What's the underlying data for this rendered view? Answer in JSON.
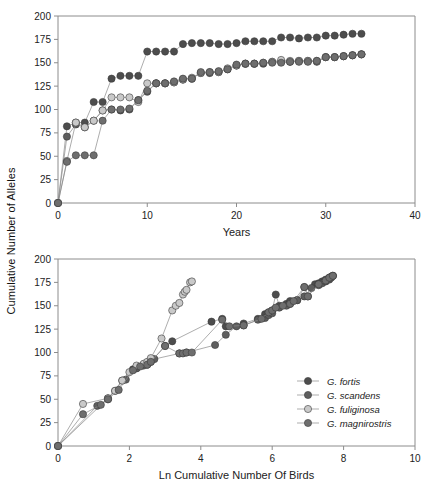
{
  "figure": {
    "y_axis_label": "Cumulative Number of Alleles"
  },
  "legend": {
    "items": [
      {
        "label": "G. fortis",
        "color": "#4d4d4d"
      },
      {
        "label": "G. scandens",
        "color": "#5e5e5e"
      },
      {
        "label": "G. fuliginosa",
        "color": "#c9c9c9"
      },
      {
        "label": "G. magnirostris",
        "color": "#6e6e6e"
      }
    ]
  },
  "chart_data": [
    {
      "type": "line",
      "panel": "top",
      "title": "",
      "xlabel": "Years",
      "ylabel": "Cumulative Number of Alleles",
      "xlim": [
        0,
        40
      ],
      "ylim": [
        0,
        200
      ],
      "xticks": [
        0,
        10,
        20,
        30,
        40
      ],
      "yticks": [
        0,
        25,
        50,
        75,
        100,
        125,
        150,
        175,
        200
      ],
      "grid": false,
      "legend_position": "none",
      "series": [
        {
          "name": "G. fortis",
          "color": "#4d4d4d",
          "x": [
            0,
            1,
            2,
            3,
            4,
            5,
            6,
            7,
            8,
            9,
            10,
            11,
            12,
            13,
            14,
            15,
            16,
            17,
            18,
            19,
            20,
            21,
            22,
            23,
            24,
            25,
            26,
            27,
            28,
            29,
            30,
            31,
            32,
            33,
            34
          ],
          "y": [
            0,
            82,
            86,
            86,
            108,
            108,
            133,
            136,
            136,
            136,
            162,
            162,
            162,
            162,
            170,
            171,
            171,
            171,
            170,
            170,
            171,
            173,
            173,
            173,
            173,
            177,
            177,
            176,
            177,
            177,
            179,
            179,
            180,
            181,
            181
          ]
        },
        {
          "name": "G. scandens",
          "color": "#5e5e5e",
          "x": [
            0,
            1,
            2,
            3,
            4,
            5,
            6,
            7,
            8,
            9,
            10,
            11,
            12,
            13,
            14,
            15,
            16,
            17,
            18,
            19,
            20,
            21,
            22,
            23,
            24,
            25,
            26,
            27,
            28,
            29,
            30,
            31,
            32,
            33,
            34
          ],
          "y": [
            0,
            71,
            84,
            81,
            88,
            99,
            100,
            99,
            100,
            110,
            119,
            128,
            128,
            129,
            132,
            133,
            139,
            139,
            140,
            143,
            147,
            149,
            149,
            149,
            151,
            151,
            151,
            152,
            152,
            151,
            156,
            156,
            157,
            158,
            159
          ]
        },
        {
          "name": "G. fuliginosa",
          "color": "#c9c9c9",
          "x": [
            0,
            1,
            2,
            3,
            4,
            5,
            6,
            7,
            8,
            9,
            10,
            11,
            12,
            13,
            14,
            15,
            16,
            17,
            18,
            19,
            20,
            21,
            22,
            23,
            24,
            25,
            26,
            27,
            28,
            29,
            30,
            31,
            32,
            33,
            34
          ],
          "y": [
            0,
            45,
            86,
            81,
            88,
            99,
            113,
            113,
            113,
            108,
            128,
            128,
            128,
            129,
            132,
            134,
            139,
            140,
            140,
            144,
            147,
            149,
            149,
            150,
            151,
            153,
            152,
            152,
            152,
            152,
            156,
            156,
            157,
            158,
            159
          ]
        },
        {
          "name": "G. magnirostris",
          "color": "#6e6e6e",
          "x": [
            0,
            1,
            2,
            3,
            4,
            5,
            6,
            7,
            8,
            9,
            10,
            11,
            12,
            13,
            14,
            15,
            16,
            17,
            18,
            19,
            20,
            21,
            22,
            23,
            24,
            25,
            26,
            27,
            28,
            29,
            30,
            31,
            32,
            33,
            34
          ],
          "y": [
            0,
            44,
            51,
            51,
            51,
            88,
            100,
            100,
            101,
            110,
            120,
            128,
            128,
            130,
            133,
            133,
            140,
            140,
            141,
            143,
            148,
            149,
            149,
            150,
            150,
            150,
            151,
            151,
            151,
            152,
            156,
            156,
            157,
            158,
            159
          ]
        }
      ]
    },
    {
      "type": "scatter",
      "panel": "bottom",
      "title": "",
      "xlabel": "Ln Cumulative Number Of Birds",
      "ylabel": "Cumulative Number of Alleles",
      "xlim": [
        0,
        10
      ],
      "ylim": [
        0,
        200
      ],
      "xticks": [
        0,
        2,
        4,
        6,
        8,
        10
      ],
      "yticks": [
        0,
        25,
        50,
        75,
        100,
        125,
        150,
        175,
        200
      ],
      "grid": false,
      "legend_position": "bottom-right",
      "series": [
        {
          "name": "G. fortis",
          "color": "#4d4d4d",
          "x": [
            0,
            1.4,
            1.8,
            2.1,
            2.2,
            2.5,
            2.6,
            3.0,
            3.2,
            4.3,
            4.6,
            4.7,
            5.2,
            5.6,
            5.8,
            5.9,
            6.0,
            6.1,
            6.2,
            6.4,
            6.5,
            6.7,
            6.9,
            7.0,
            7.2,
            7.3,
            7.4,
            7.5,
            7.6,
            7.65,
            7.7
          ],
          "y": [
            0,
            51,
            70,
            82,
            84,
            87,
            90,
            107,
            112,
            133,
            136,
            128,
            131,
            136,
            141,
            143,
            145,
            162,
            150,
            152,
            155,
            156,
            170,
            160,
            173,
            174,
            176,
            178,
            180,
            181,
            182
          ]
        },
        {
          "name": "G. scandens",
          "color": "#5e5e5e",
          "x": [
            0,
            1.1,
            1.4,
            1.6,
            1.9,
            2.2,
            2.4,
            2.5,
            2.7,
            3.4,
            3.6,
            4.4,
            4.7,
            5.0,
            5.2,
            5.6,
            5.8,
            5.9,
            6.0,
            6.2,
            6.4,
            6.5,
            6.7,
            6.9,
            7.1,
            7.3,
            7.4,
            7.5,
            7.6,
            7.65,
            7.7
          ],
          "y": [
            0,
            43,
            50,
            59,
            71,
            83,
            86,
            88,
            93,
            99,
            100,
            108,
            119,
            128,
            129,
            135,
            137,
            140,
            142,
            148,
            150,
            152,
            156,
            160,
            169,
            172,
            174,
            176,
            178,
            180,
            182
          ]
        },
        {
          "name": "G. fuliginosa",
          "color": "#c9c9c9",
          "x": [
            0,
            0.7,
            1.4,
            1.6,
            1.8,
            2.0,
            2.2,
            2.4,
            2.5,
            2.6,
            2.9,
            3.2,
            3.3,
            3.4,
            3.5,
            3.55,
            3.6,
            3.7,
            3.75
          ],
          "y": [
            0,
            45,
            51,
            59,
            70,
            79,
            86,
            88,
            90,
            94,
            115,
            145,
            150,
            153,
            162,
            165,
            167,
            175,
            176
          ]
        },
        {
          "name": "G. magnirostris",
          "color": "#6e6e6e",
          "x": [
            0,
            0.7,
            1.2,
            1.4,
            1.7,
            2.1,
            2.3,
            2.5,
            2.6,
            3.0,
            3.4,
            3.5,
            3.6,
            3.75,
            4.6,
            4.8,
            5.2,
            5.7,
            5.9,
            6.0,
            6.1,
            6.3,
            6.5,
            6.6,
            6.9,
            7.0,
            7.3,
            7.5,
            7.6,
            7.7
          ],
          "y": [
            0,
            34,
            44,
            50,
            60,
            81,
            85,
            87,
            90,
            107,
            99,
            99,
            100,
            100,
            135,
            128,
            129,
            136,
            143,
            145,
            148,
            150,
            152,
            155,
            170,
            160,
            173,
            177,
            180,
            182
          ]
        }
      ]
    }
  ]
}
